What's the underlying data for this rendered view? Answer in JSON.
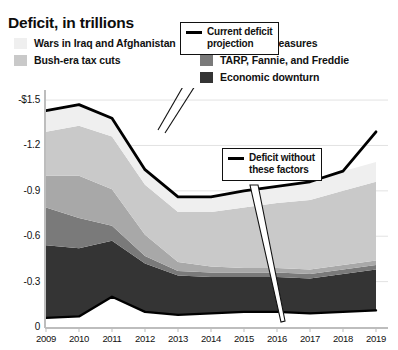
{
  "title": "Deficit, in trillions",
  "legend": {
    "left": [
      {
        "label": "Wars in Iraq and Afghanistan",
        "color": "#efefef",
        "key": "wars"
      },
      {
        "label": "Bush-era tax cuts",
        "color": "#c9c9c9",
        "key": "bush_tax_cuts"
      }
    ],
    "right": [
      {
        "label": "Recovery measures",
        "color": "#a8a8a8",
        "key": "recovery"
      },
      {
        "label": "TARP, Fannie, and Freddie",
        "color": "#7a7a7a",
        "key": "tarp"
      },
      {
        "label": "Economic downturn",
        "color": "#343434",
        "key": "downturn"
      }
    ]
  },
  "annotations": [
    {
      "id": "current",
      "dash_color": "#000000",
      "text": "Current deficit\nprojection"
    },
    {
      "id": "without",
      "dash_color": "#000000",
      "text": "Deficit without\nthese factors"
    }
  ],
  "chart_data": {
    "type": "area",
    "stacked": true,
    "title": "Deficit, in trillions",
    "xlabel": "",
    "ylabel": "",
    "x": [
      2009,
      2010,
      2011,
      2012,
      2013,
      2014,
      2015,
      2016,
      2017,
      2018,
      2019
    ],
    "x_tick_labels": [
      "2009",
      "2010",
      "2011",
      "2012",
      "2013",
      "2014",
      "2015",
      "2016",
      "2017",
      "2018",
      "2019"
    ],
    "y_tick_values": [
      0,
      -0.3,
      -0.6,
      -0.9,
      -1.2,
      -1.5
    ],
    "y_tick_labels": [
      "0",
      "-0.3",
      "-0.6",
      "-0.9",
      "-1.2",
      "-$1.5"
    ],
    "ylim": [
      -1.5,
      0
    ],
    "grid": true,
    "legend_position": "top",
    "units": "trillions of dollars",
    "sign_convention": "deficits shown as negative magnitudes stacked downward",
    "series": [
      {
        "name": "Deficit without these factors",
        "key": "base",
        "color": "#ffffff",
        "values": [
          -0.06,
          -0.07,
          -0.2,
          -0.1,
          -0.08,
          -0.09,
          -0.1,
          -0.1,
          -0.09,
          -0.1,
          -0.11
        ]
      },
      {
        "name": "Economic downturn",
        "key": "downturn",
        "color": "#343434",
        "values": [
          -0.48,
          -0.45,
          -0.37,
          -0.32,
          -0.26,
          -0.24,
          -0.23,
          -0.23,
          -0.23,
          -0.25,
          -0.27
        ]
      },
      {
        "name": "TARP, Fannie, and Freddie",
        "key": "tarp",
        "color": "#7a7a7a",
        "values": [
          -0.25,
          -0.2,
          -0.1,
          -0.05,
          -0.03,
          -0.03,
          -0.03,
          -0.03,
          -0.03,
          -0.03,
          -0.03
        ]
      },
      {
        "name": "Recovery measures",
        "key": "recovery",
        "color": "#a8a8a8",
        "values": [
          -0.21,
          -0.28,
          -0.24,
          -0.14,
          -0.06,
          -0.04,
          -0.03,
          -0.03,
          -0.03,
          -0.03,
          -0.03
        ]
      },
      {
        "name": "Bush-era tax cuts",
        "key": "bush_tax_cuts",
        "color": "#c9c9c9",
        "values": [
          -0.29,
          -0.33,
          -0.35,
          -0.33,
          -0.33,
          -0.36,
          -0.4,
          -0.43,
          -0.46,
          -0.49,
          -0.52
        ]
      },
      {
        "name": "Wars in Iraq and Afghanistan",
        "key": "wars",
        "color": "#efefef",
        "values": [
          -0.14,
          -0.14,
          -0.12,
          -0.1,
          -0.1,
          -0.1,
          -0.11,
          -0.11,
          -0.12,
          -0.13,
          -0.13
        ]
      }
    ],
    "total_line": {
      "name": "Current deficit projection",
      "color": "#000000",
      "values": [
        -1.43,
        -1.47,
        -1.38,
        -1.04,
        -0.86,
        -0.86,
        -0.9,
        -0.93,
        -0.96,
        -1.03,
        -1.29
      ]
    },
    "baseline_line": {
      "name": "Deficit without these factors",
      "color": "#000000",
      "values": [
        -0.06,
        -0.07,
        -0.2,
        -0.1,
        -0.08,
        -0.09,
        -0.1,
        -0.1,
        -0.09,
        -0.1,
        -0.11
      ]
    }
  }
}
